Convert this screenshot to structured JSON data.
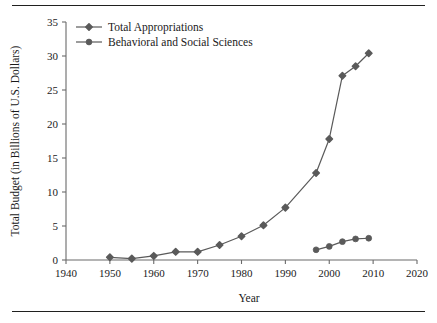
{
  "figure": {
    "background_color": "#ffffff",
    "rule_color": "#20201f",
    "has_top_rule": true,
    "has_bottom_rule": true
  },
  "chart_data": {
    "type": "line",
    "title": "",
    "xlabel": "Year",
    "ylabel": "Total Budget (in Billions of U.S. Dollars)",
    "xlim": [
      1940,
      2020
    ],
    "ylim": [
      0,
      35
    ],
    "xticks": [
      1940,
      1950,
      1960,
      1970,
      1980,
      1990,
      2000,
      2010,
      2020
    ],
    "yticks": [
      0,
      5,
      10,
      15,
      20,
      25,
      30,
      35
    ],
    "xtick_labels": [
      "1940",
      "1950",
      "1960",
      "1970",
      "1980",
      "1990",
      "2000",
      "2010",
      "2020"
    ],
    "ytick_labels": [
      "0",
      "5",
      "10",
      "15",
      "20",
      "25",
      "30",
      "35"
    ],
    "grid": false,
    "legend_position": "top-left",
    "series": [
      {
        "name": "Total Appropriations",
        "marker": "diamond",
        "color": "#5a5a5a",
        "x": [
          1950,
          1955,
          1960,
          1965,
          1970,
          1975,
          1980,
          1985,
          1990,
          1997,
          2000,
          2003,
          2006,
          2009
        ],
        "values": [
          0.4,
          0.2,
          0.6,
          1.2,
          1.2,
          2.2,
          3.5,
          5.1,
          7.7,
          12.8,
          17.8,
          27.1,
          28.5,
          30.4
        ]
      },
      {
        "name": "Behavioral and Social Sciences",
        "marker": "circle",
        "color": "#5a5a5a",
        "x": [
          1997,
          2000,
          2003,
          2006,
          2009
        ],
        "values": [
          1.5,
          2.0,
          2.7,
          3.1,
          3.2
        ]
      }
    ]
  }
}
